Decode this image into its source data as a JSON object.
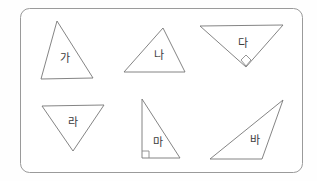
{
  "figure": {
    "background_color": "#fefefe",
    "panel": {
      "name": "rounded-rectangle-panel",
      "x": 20,
      "y": 8,
      "width": 283,
      "height": 165,
      "corner_radius": 9,
      "stroke_color": "#9a9a9a",
      "fill_color": "#ffffff"
    },
    "stroke_color": "#767676",
    "label_color": "#3c3c3c",
    "triangles": [
      {
        "id": "triangle-ga",
        "label": "가",
        "points": "57,21 41,79 93,78",
        "label_x": 65,
        "label_y": 59,
        "kind": "acute-scalene",
        "right_angle": null
      },
      {
        "id": "triangle-na",
        "label": "나",
        "points": "163,28 124,72 185,72",
        "label_x": 159,
        "label_y": 56,
        "kind": "acute-scalene",
        "right_angle": null
      },
      {
        "id": "triangle-da",
        "label": "다",
        "points": "200,26 283,25 246,67",
        "label_x": 243,
        "label_y": 44,
        "kind": "right-triangle-inverted",
        "right_angle": {
          "marker": "diamond",
          "x": 246,
          "y": 60,
          "size": 5
        }
      },
      {
        "id": "triangle-ra",
        "label": "라",
        "points": "42,106 104,105 73,151",
        "label_x": 73,
        "label_y": 123,
        "kind": "isosceles-inverted",
        "right_angle": null
      },
      {
        "id": "triangle-ma",
        "label": "마",
        "points": "142,99 142,158 180,158",
        "label_x": 158,
        "label_y": 143,
        "kind": "right-triangle",
        "right_angle": {
          "marker": "square",
          "x": 142,
          "y": 158,
          "size": 7
        }
      },
      {
        "id": "triangle-ba",
        "label": "바",
        "points": "283,100 210,159 262,159",
        "label_x": 255,
        "label_y": 141,
        "kind": "obtuse-scalene",
        "right_angle": null
      }
    ]
  }
}
